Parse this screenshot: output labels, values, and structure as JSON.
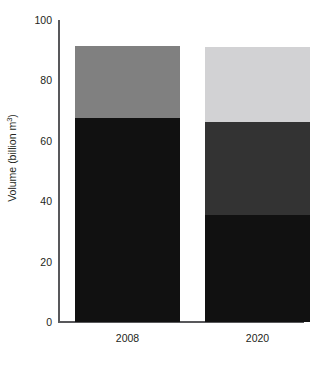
{
  "chart_data": {
    "type": "bar",
    "subtype": "stacked-bar",
    "title": "",
    "clipped_top_text": "",
    "xlabel": "",
    "ylabel": "Volume (billion m",
    "ylabel_sup": "3",
    "ylabel_suffix": ")",
    "ylabel_full": "Volume (billion m³)",
    "categories": [
      "2008",
      "2020"
    ],
    "ylim": [
      0,
      100
    ],
    "yticks": [
      100,
      80,
      60,
      40,
      20,
      0
    ],
    "ytick_labels": [
      "100",
      "80",
      "60",
      "40",
      "20",
      "0"
    ],
    "grid": false,
    "legend": "none",
    "axis_color": "#58585b",
    "series": [
      {
        "name": "segment-bottom",
        "color": "#111111",
        "values": [
          67.5,
          35.5
        ]
      },
      {
        "name": "segment-middle",
        "color": "#333333",
        "values": [
          0,
          30.7
        ]
      },
      {
        "name": "segment-top",
        "color_2008": "#808080",
        "color_2020": "#d2d2d4",
        "values": [
          24.0,
          24.8
        ]
      }
    ],
    "bars": [
      {
        "category": "2008",
        "total": 91.5,
        "segments": [
          {
            "label": "bottom",
            "value": 67.5,
            "color": "#111111"
          },
          {
            "label": "top",
            "value": 24.0,
            "color": "#808080"
          }
        ]
      },
      {
        "category": "2020",
        "total": 91.0,
        "segments": [
          {
            "label": "bottom",
            "value": 35.5,
            "color": "#111111"
          },
          {
            "label": "middle",
            "value": 30.7,
            "color": "#333333"
          },
          {
            "label": "top",
            "value": 24.8,
            "color": "#d2d2d4"
          }
        ]
      }
    ]
  }
}
